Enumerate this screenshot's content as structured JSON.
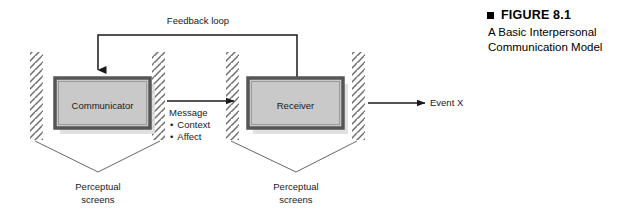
{
  "figure": {
    "caption_marker": "square-bullet",
    "caption_title": "FIGURE 8.1",
    "caption_line1": "A Basic Interpersonal",
    "caption_line2": "Communication Model"
  },
  "diagram": {
    "type": "process-flow",
    "background": "#ffffff",
    "nodes": [
      {
        "id": "communicator",
        "label": "Communicator",
        "x": 55,
        "y": 78,
        "width": 95,
        "height": 50,
        "fill": "#c9c9c9",
        "border": "#565656",
        "shadow": "#d9d9d9"
      },
      {
        "id": "receiver",
        "label": "Receiver",
        "x": 248,
        "y": 78,
        "width": 95,
        "height": 50,
        "fill": "#c9c9c9",
        "border": "#565656",
        "shadow": "#d9d9d9"
      }
    ],
    "screens": [
      {
        "id": "screen-left-outer",
        "x": 30,
        "top": 52,
        "bottom": 140
      },
      {
        "id": "screen-left-inner",
        "x": 152,
        "top": 52,
        "bottom": 140
      },
      {
        "id": "screen-right-inner",
        "x": 225,
        "top": 52,
        "bottom": 140
      },
      {
        "id": "screen-right-outer",
        "x": 352,
        "top": 52,
        "bottom": 140
      }
    ],
    "labels": {
      "feedback_loop": "Feedback loop",
      "message": "Message",
      "message_items": [
        "Context",
        "Affect"
      ],
      "event": "Event X",
      "perceptual_left_line1": "Perceptual",
      "perceptual_left_line2": "screens",
      "perceptual_right_line1": "Perceptual",
      "perceptual_right_line2": "screens"
    },
    "connectors": [
      {
        "id": "feedback-loop",
        "from": "receiver-top",
        "to": "communicator-top",
        "style": "orthogonal-arrow"
      },
      {
        "id": "message-arrow",
        "from": "communicator",
        "to": "receiver",
        "style": "straight-arrow"
      },
      {
        "id": "event-arrow",
        "from": "receiver",
        "to": "event-x",
        "style": "straight-arrow"
      }
    ],
    "colors": {
      "line": "#1a1a1a",
      "hatch": "#6e6e6e",
      "funnel": "#555555"
    }
  }
}
